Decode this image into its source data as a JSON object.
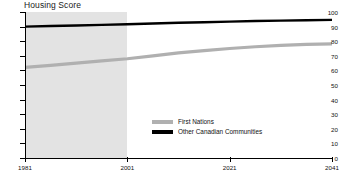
{
  "chart_data": {
    "type": "line",
    "title": "Housing Score",
    "xlabel": "",
    "ylabel": "",
    "xlim": [
      1981,
      2041
    ],
    "ylim": [
      0,
      100
    ],
    "grid": false,
    "legend_position": "inside-center",
    "x_ticks": [
      "1981",
      "2001",
      "2021",
      "2041"
    ],
    "x_tick_values": [
      1981,
      2001,
      2021,
      2041
    ],
    "y_ticks": [
      "0",
      "10",
      "20",
      "30",
      "40",
      "50",
      "60",
      "70",
      "80",
      "90",
      "100"
    ],
    "y_tick_values": [
      0,
      10,
      20,
      30,
      40,
      50,
      60,
      70,
      80,
      90,
      100
    ],
    "shaded_region": {
      "label": "historical",
      "x_from": 1981,
      "x_to": 2001,
      "color": "#e3e3e3"
    },
    "series": [
      {
        "name": "First Nations",
        "color": "#b0b0b0",
        "x": [
          1981,
          1986,
          1991,
          1996,
          2001,
          2006,
          2011,
          2016,
          2021,
          2026,
          2031,
          2036,
          2041
        ],
        "values": [
          62,
          63.5,
          65,
          66.5,
          68,
          70,
          72,
          73.5,
          75,
          76.2,
          77.2,
          77.8,
          78.2
        ]
      },
      {
        "name": "Other Canadian Communities",
        "color": "#000000",
        "x": [
          1981,
          1986,
          1991,
          1996,
          2001,
          2006,
          2011,
          2016,
          2021,
          2026,
          2031,
          2036,
          2041
        ],
        "values": [
          90,
          90.4,
          90.8,
          91.2,
          91.6,
          92.1,
          92.6,
          93.0,
          93.4,
          93.8,
          94.1,
          94.4,
          94.6
        ]
      }
    ]
  },
  "legend": {
    "entries": [
      {
        "label": "First Nations",
        "color": "#b0b0b0"
      },
      {
        "label": "Other Canadian Communities",
        "color": "#000000"
      }
    ]
  }
}
